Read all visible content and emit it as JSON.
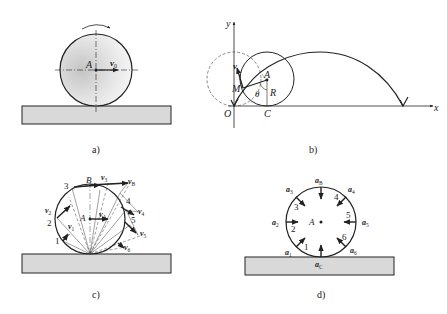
{
  "panels": {
    "a": {
      "caption": "a)",
      "center_label": "A",
      "velocity_label": "v",
      "velocity_sub": "0"
    },
    "b": {
      "caption": "b)",
      "axis_y": "y",
      "axis_x": "x",
      "origin": "O",
      "point_M": "M",
      "point_A": "A",
      "point_C": "C",
      "radius": "R",
      "angle": "θ",
      "velocity": "v"
    },
    "c": {
      "caption": "c)",
      "center_label": "A",
      "top_point": "B",
      "points": [
        "1",
        "2",
        "3",
        "4",
        "5"
      ],
      "velocity_labels": [
        {
          "base": "v",
          "sub": "1"
        },
        {
          "base": "v",
          "sub": "2"
        },
        {
          "base": "v",
          "sub": "3"
        },
        {
          "base": "v",
          "sub": "B"
        },
        {
          "base": "v",
          "sub": "A"
        },
        {
          "base": "v",
          "sub": "4"
        },
        {
          "base": "v",
          "sub": "5"
        },
        {
          "base": "v",
          "sub": "6"
        }
      ]
    },
    "d": {
      "caption": "d)",
      "center_label": "A",
      "points": [
        "1",
        "2",
        "3",
        "4",
        "5",
        "6"
      ],
      "accel_labels": [
        {
          "base": "a",
          "sub": "B"
        },
        {
          "base": "a",
          "sub": "3"
        },
        {
          "base": "a",
          "sub": "4"
        },
        {
          "base": "a",
          "sub": "2"
        },
        {
          "base": "a",
          "sub": "5"
        },
        {
          "base": "a",
          "sub": "1"
        },
        {
          "base": "a",
          "sub": "6"
        },
        {
          "base": "a",
          "sub": "C"
        }
      ]
    }
  },
  "colors": {
    "ink": "#222222",
    "ground_fill": "#d9d9d9",
    "wheel_shade": "#cfcfcf"
  }
}
